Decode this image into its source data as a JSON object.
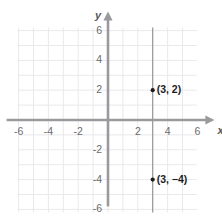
{
  "chart_data": {
    "type": "scatter",
    "title": "",
    "xlabel": "x",
    "ylabel": "y",
    "xlim": [
      -7,
      7
    ],
    "ylim": [
      -7,
      7
    ],
    "grid": true,
    "grid_step": 1,
    "legend": "none",
    "x_ticks": [
      "-6",
      "-4",
      "-2",
      "2",
      "4",
      "6"
    ],
    "x_tick_values": [
      -6,
      -4,
      -2,
      2,
      4,
      6
    ],
    "y_ticks": [
      "6",
      "4",
      "2",
      "-2",
      "-4",
      "-6"
    ],
    "y_tick_values": [
      6,
      4,
      2,
      -2,
      -4,
      -6
    ],
    "points": [
      {
        "x": 3,
        "y": 2,
        "label": "(3, 2)"
      },
      {
        "x": 3,
        "y": -4,
        "label": "(3, −4)"
      }
    ],
    "lines": [
      {
        "name": "vertical-line-x-3",
        "type": "vertical",
        "x": 3,
        "y_from": -6.2,
        "y_to": 6.2
      }
    ],
    "colors": {
      "grid": "#e9e9ec",
      "axis": "#9a9a9e",
      "reference_line": "#8f8f93",
      "point": "#1d1d1f",
      "label": "#1d1d1f",
      "tick": "#6b6b6d"
    }
  }
}
